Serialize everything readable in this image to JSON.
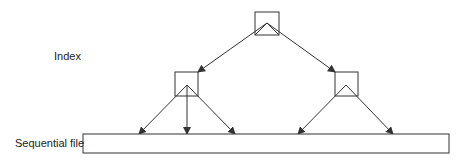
{
  "labels": {
    "index": "Index",
    "sequential_file": "Sequential file"
  },
  "colors": {
    "stroke": "#333333",
    "background": "#ffffff"
  },
  "nodes": [
    {
      "id": "root",
      "x": 255,
      "y": 12,
      "w": 24,
      "h": 23,
      "apex": [
        267,
        23
      ]
    },
    {
      "id": "left",
      "x": 175,
      "y": 72,
      "w": 23,
      "h": 24,
      "apex": [
        187,
        85
      ]
    },
    {
      "id": "right",
      "x": 335,
      "y": 72,
      "w": 23,
      "h": 24,
      "apex": [
        346,
        85
      ]
    }
  ],
  "sequential_file_bar": {
    "x": 83,
    "y": 134,
    "w": 366,
    "h": 19
  },
  "edges": [
    {
      "from": "root",
      "to": "left",
      "x1": 267,
      "y1": 23,
      "x2": 198,
      "y2": 72
    },
    {
      "from": "root",
      "to": "right",
      "x1": 267,
      "y1": 23,
      "x2": 335,
      "y2": 72
    },
    {
      "from": "left",
      "to": "file",
      "x1": 187,
      "y1": 85,
      "x2": 139,
      "y2": 134
    },
    {
      "from": "left",
      "to": "file",
      "x1": 187,
      "y1": 85,
      "x2": 187,
      "y2": 134
    },
    {
      "from": "left",
      "to": "file",
      "x1": 187,
      "y1": 85,
      "x2": 235,
      "y2": 134
    },
    {
      "from": "right",
      "to": "file",
      "x1": 346,
      "y1": 85,
      "x2": 298,
      "y2": 134
    },
    {
      "from": "right",
      "to": "file",
      "x1": 346,
      "y1": 85,
      "x2": 393,
      "y2": 134
    }
  ]
}
